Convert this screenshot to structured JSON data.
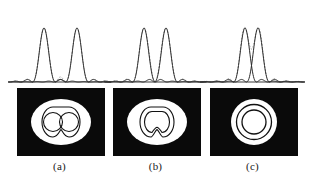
{
  "figure": {
    "background_color": "#ffffff",
    "curve_color": "#2b2b2b",
    "dashed_color": "#8c8c8c",
    "baseline_color": "#3a3a3a",
    "panel_bg_color": "#0a0a0a",
    "panel_fg_color": "#ffffff",
    "ring_color": "#111111"
  },
  "panels": [
    {
      "id": "a",
      "caption": "(a)",
      "left": 8,
      "width": 103,
      "state": "well-resolved",
      "separation_px": 33,
      "peak1_x": 36,
      "peak2_x": 69,
      "peak_height": 54,
      "baseline_y": 78,
      "sum_dashed_visible": true,
      "sum_dip_depth": 0.26,
      "image": {
        "left": 9,
        "top": 0,
        "width": 88,
        "height": 68,
        "type": "two-separate-disks",
        "center1_x": 37,
        "center2_x": 53,
        "center_y": 34,
        "disk_radius": 9.5,
        "halo_rx": 30,
        "halo_ry": 23,
        "inner_ring_rx": 24,
        "inner_ring_ry": 17
      }
    },
    {
      "id": "b",
      "caption": "(b)",
      "left": 104,
      "width": 103,
      "state": "rayleigh-limit",
      "separation_px": 22,
      "peak1_x": 40,
      "peak2_x": 62,
      "peak_height": 54,
      "baseline_y": 78,
      "sum_dashed_visible": true,
      "sum_dip_depth": 0.12,
      "image": {
        "left": 9,
        "top": 0,
        "width": 88,
        "height": 68,
        "type": "merged-peanut",
        "center1_x": 40,
        "center2_x": 52,
        "center_y": 34,
        "disk_radius": 11,
        "halo_rx": 30,
        "halo_ry": 23,
        "inner_ring_rx": 24,
        "inner_ring_ry": 17
      }
    },
    {
      "id": "c",
      "caption": "(c)",
      "left": 200,
      "width": 105,
      "state": "unresolved",
      "separation_px": 13,
      "peak1_x": 45,
      "peak2_x": 58,
      "peak_height": 54,
      "baseline_y": 78,
      "sum_dashed_visible": true,
      "sum_dip_depth": 0.0,
      "sum_arch_height": 72,
      "image": {
        "left": 10,
        "top": 0,
        "width": 88,
        "height": 68,
        "type": "concentric-rings",
        "center_x": 44,
        "center_y": 34,
        "core_radius": 12,
        "ring_radius_1": 17,
        "ring_radius_2": 23
      }
    }
  ],
  "chart_data": {
    "type": "line",
    "xlabel": "",
    "ylabel": "",
    "series": [
      {
        "name": "Source 1 Airy profile (a)",
        "peak_center": 36,
        "peak_height": 54
      },
      {
        "name": "Source 2 Airy profile (a)",
        "peak_center": 69,
        "peak_height": 54
      },
      {
        "name": "Sum (a)",
        "style": "dashed",
        "dip_fraction": 0.74
      },
      {
        "name": "Source 1 Airy profile (b)",
        "peak_center": 40,
        "peak_height": 54
      },
      {
        "name": "Source 2 Airy profile (b)",
        "peak_center": 62,
        "peak_height": 54
      },
      {
        "name": "Sum (b)",
        "style": "dashed",
        "dip_fraction": 0.88
      },
      {
        "name": "Source 1 Airy profile (c)",
        "peak_center": 45,
        "peak_height": 54
      },
      {
        "name": "Source 2 Airy profile (c)",
        "peak_center": 58,
        "peak_height": 54
      },
      {
        "name": "Sum (c)",
        "style": "dashed",
        "dip_fraction": 1.0
      }
    ],
    "grid": false,
    "legend": "none"
  }
}
